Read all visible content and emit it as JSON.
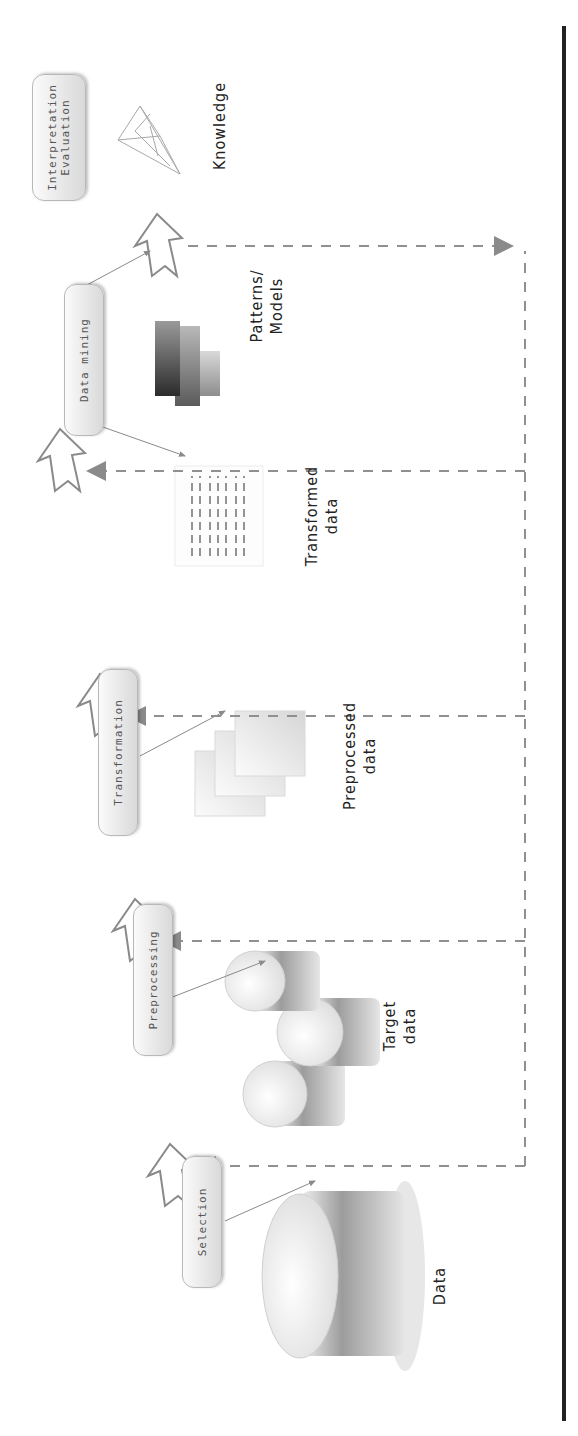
{
  "diagram": {
    "orientation": "rotated 90deg counterclockwise",
    "steps": [
      {
        "label": "Selection"
      },
      {
        "label": "Preprocessing"
      },
      {
        "label": "Transformation"
      },
      {
        "label": "Data mining"
      },
      {
        "label_line1": "Interpretation",
        "label_line2": "Evaluation"
      }
    ],
    "artifacts": [
      {
        "label": "Data",
        "icon": "large-database-icon"
      },
      {
        "label_line1": "Target",
        "label_line2": "data",
        "icon": "database-cluster-icon"
      },
      {
        "label_line1": "Preprocessed",
        "label_line2": "data",
        "icon": "stacked-documents-icon"
      },
      {
        "label_line1": "Transformed",
        "label_line2": "data",
        "icon": "table-document-icon"
      },
      {
        "label_line1": "Patterns/",
        "label_line2": "Models",
        "icon": "bar-blocks-icon"
      },
      {
        "label": "Knowledge",
        "icon": "wireframe-pyramid-icon"
      }
    ],
    "feedback_loop": "dashed feedback lines returning to each step",
    "colors": {
      "arrow_stroke": "#8a8a8a",
      "dash": "#909090",
      "pill_top": "#fbfbfb",
      "pill_bottom": "#d9d9d9",
      "rail": "#222222"
    }
  }
}
